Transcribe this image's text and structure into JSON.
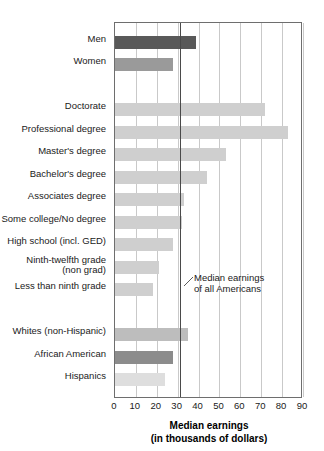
{
  "chart_data": {
    "type": "bar",
    "orientation": "horizontal",
    "title": "Median earnings",
    "subtitle": "(in thousands of dollars)",
    "xlabel": "Median earnings (in thousands of dollars)",
    "ylabel": "",
    "xlim": [
      0,
      90
    ],
    "xticks": [
      0,
      10,
      20,
      30,
      40,
      50,
      60,
      70,
      80,
      90
    ],
    "xtick_labels": [
      "0",
      "10",
      "20",
      "30",
      "40",
      "50",
      "60",
      "70",
      "80",
      "90"
    ],
    "grid": "vertical",
    "legend": "none",
    "reference_line": {
      "value": 31,
      "label": "Median earnings\nof all Americans",
      "color": "#4a4a4a"
    },
    "annotations": [
      {
        "text": "Median earnings\nof all Americans",
        "target_value": 31
      }
    ],
    "categories": [
      "Men",
      "Women",
      "",
      "Doctorate",
      "Professional degree",
      "Master's degree",
      "Bachelor's degree",
      "Associates degree",
      "Some college/No degree",
      "High school (incl. GED)",
      "Ninth-twelfth grade\n(non grad)",
      "Less than ninth grade",
      "",
      "Whites (non-Hispanic)",
      "African American",
      "Hispanics"
    ],
    "values": [
      39,
      28,
      null,
      72,
      83,
      53,
      44,
      33,
      32,
      28,
      21,
      18,
      null,
      35,
      28,
      24
    ],
    "bars": [
      {
        "label": "Men",
        "value": 39,
        "color": "#595959",
        "row": 0
      },
      {
        "label": "Women",
        "value": 28,
        "color": "#9a9a9a",
        "row": 1
      },
      {
        "label": "Doctorate",
        "value": 72,
        "color": "#cfcfcf",
        "row": 3
      },
      {
        "label": "Professional degree",
        "value": 83,
        "color": "#cfcfcf",
        "row": 4
      },
      {
        "label": "Master's degree",
        "value": 53,
        "color": "#cfcfcf",
        "row": 5
      },
      {
        "label": "Bachelor's degree",
        "value": 44,
        "color": "#cfcfcf",
        "row": 6
      },
      {
        "label": "Associates degree",
        "value": 33,
        "color": "#cfcfcf",
        "row": 7
      },
      {
        "label": "Some college/No degree",
        "value": 32,
        "color": "#cfcfcf",
        "row": 8
      },
      {
        "label": "High school (incl. GED)",
        "value": 28,
        "color": "#cfcfcf",
        "row": 9
      },
      {
        "label": "Ninth-twelfth grade (non grad)",
        "value": 21,
        "color": "#cfcfcf",
        "row": 10
      },
      {
        "label": "Less than ninth grade",
        "value": 18,
        "color": "#cfcfcf",
        "row": 11
      },
      {
        "label": "Whites (non-Hispanic)",
        "value": 35,
        "color": "#bdbdbd",
        "row": 13
      },
      {
        "label": "African American",
        "value": 28,
        "color": "#8c8c8c",
        "row": 14
      },
      {
        "label": "Hispanics",
        "value": 24,
        "color": "#dedede",
        "row": 15
      }
    ]
  },
  "labels": {
    "men": "Men",
    "women": "Women",
    "doctorate": "Doctorate",
    "professional_degree": "Professional degree",
    "masters_degree": "Master's degree",
    "bachelors_degree": "Bachelor's degree",
    "associates_degree": "Associates degree",
    "some_college": "Some college/No degree",
    "high_school": "High school (incl. GED)",
    "ninth_twelfth": "Ninth-twelfth grade\n(non grad)",
    "less_than_ninth": "Less than ninth grade",
    "whites": "Whites (non-Hispanic)",
    "african_american": "African American",
    "hispanics": "Hispanics"
  },
  "axis": {
    "title_line1": "Median earnings",
    "title_line2": "(in thousands of dollars)"
  },
  "annotation": {
    "text": "Median earnings\nof all Americans"
  }
}
